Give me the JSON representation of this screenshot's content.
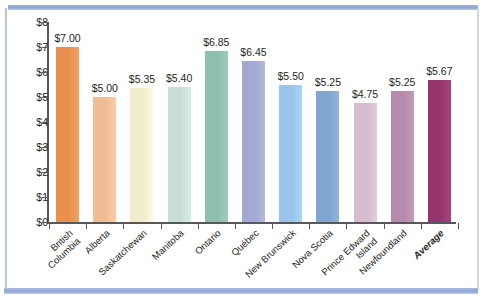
{
  "chart_data": {
    "type": "bar",
    "title": "",
    "subtitle": "",
    "xlabel": "",
    "ylabel": "",
    "ylim": [
      0,
      8
    ],
    "grid": false,
    "legend": null,
    "y_tick_labels": [
      "$8",
      "$7",
      "$6",
      "$5",
      "$4",
      "$3",
      "$2",
      "$1",
      "$0"
    ],
    "y_tick_values": [
      8,
      7,
      6,
      5,
      4,
      3,
      2,
      1,
      0
    ],
    "categories": [
      "British Columbia",
      "Alberta",
      "Saskatchewan",
      "Manitoba",
      "Ontario",
      "Québec",
      "New Brunswick",
      "Nova Scotia",
      "Prince Edward Island",
      "Newfoundland",
      "Average"
    ],
    "category_lines": [
      [
        "British",
        "Columbia"
      ],
      [
        "Alberta"
      ],
      [
        "Saskatchewan"
      ],
      [
        "Manitoba"
      ],
      [
        "Ontario"
      ],
      [
        "Québec"
      ],
      [
        "New Brunswick"
      ],
      [
        "Nova Scotia"
      ],
      [
        "Prince Edward",
        "Island"
      ],
      [
        "Newfoundland"
      ],
      [
        "Average"
      ]
    ],
    "values": [
      7.0,
      5.0,
      5.35,
      5.4,
      6.85,
      6.45,
      5.5,
      5.25,
      4.75,
      5.25,
      5.67
    ],
    "data_labels": [
      "$7.00",
      "$5.00",
      "$5.35",
      "$5.40",
      "$6.85",
      "$6.45",
      "$5.50",
      "$5.25",
      "$4.75",
      "$5.25",
      "$5.67"
    ],
    "bar_colors": [
      "#e8914f",
      "#f0bc95",
      "#f2ebcd",
      "#c7dfd4",
      "#8dbfac",
      "#a2a9d2",
      "#9bc5e8",
      "#7fa5d0",
      "#d5bcce",
      "#b58aab",
      "#96356d"
    ],
    "emphasis_index": 10
  },
  "decor": {
    "rule_color": "#8da5d4",
    "axis_color": "#58585a"
  }
}
